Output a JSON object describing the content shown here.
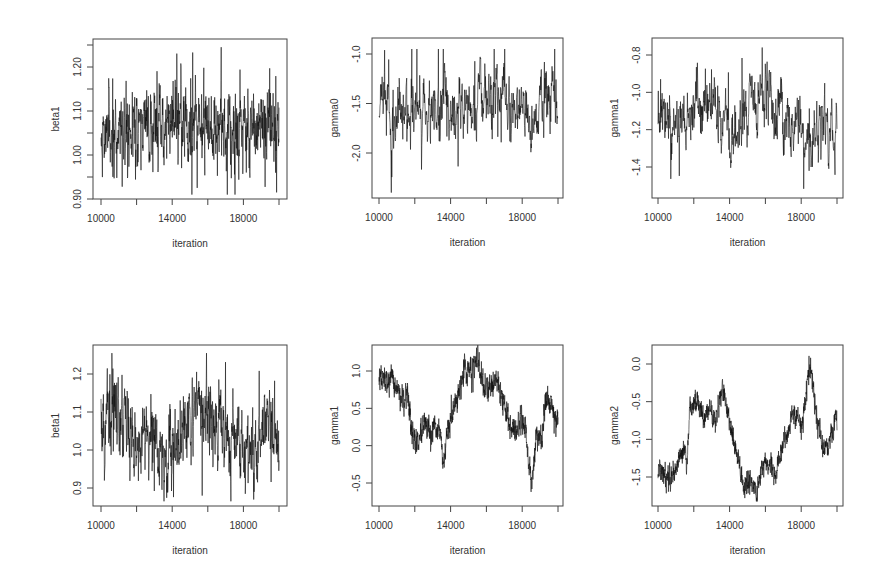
{
  "chart_data": [
    {
      "type": "line",
      "panel": "top-left",
      "title": "",
      "xlabel": "iteration",
      "ylabel": "beta1",
      "xlim": [
        10000,
        20000
      ],
      "ylim": [
        0.885,
        1.25
      ],
      "xticks": [
        10000,
        12000,
        14000,
        16000,
        18000,
        20000
      ],
      "xtick_labels": [
        "10000",
        "",
        "14000",
        "",
        "18000",
        ""
      ],
      "yticks": [
        0.9,
        0.95,
        1.0,
        1.05,
        1.1,
        1.15,
        1.2,
        1.25
      ],
      "ytick_labels": [
        "0.90",
        "",
        "1.00",
        "",
        "1.10",
        "",
        "1.20",
        ""
      ],
      "frame": {
        "x": 93,
        "y": 39,
        "w": 194,
        "h": 160
      },
      "x_px": [
        101,
        279
      ],
      "y_px": {
        "v0": 0.9,
        "p0": 199,
        "v1": 1.2,
        "p1": 67
      },
      "trace": {
        "kind": "fast",
        "mean": 1.065,
        "sd": 0.045,
        "ar": 0.55,
        "min": 0.91,
        "max": 1.245,
        "n": 900,
        "seed": 11,
        "drift": [
          [
            10000,
            1.05
          ],
          [
            12000,
            1.06
          ],
          [
            14000,
            1.08
          ],
          [
            16000,
            1.07
          ],
          [
            18000,
            1.06
          ],
          [
            20000,
            1.07
          ]
        ]
      },
      "grid": false,
      "grid_note": "MCMC trace plot, well mixed"
    },
    {
      "type": "line",
      "panel": "top-middle",
      "title": "",
      "xlabel": "iteration",
      "ylabel": "gamma0",
      "xlim": [
        10000,
        20000
      ],
      "ylim": [
        -2.45,
        -0.85
      ],
      "xticks": [
        10000,
        12000,
        14000,
        16000,
        18000,
        20000
      ],
      "xtick_labels": [
        "10000",
        "",
        "14000",
        "",
        "18000",
        ""
      ],
      "yticks": [
        -2.0,
        -1.5,
        -1.0
      ],
      "ytick_labels": [
        "-2.0",
        "-1.5",
        "-1.0"
      ],
      "frame": {
        "x": 372,
        "y": 38,
        "w": 191,
        "h": 160
      },
      "x_px": [
        379,
        558
      ],
      "y_px": {
        "v0": -2.0,
        "p0": 153,
        "v1": -1.0,
        "p1": 54
      },
      "trace": {
        "kind": "fast",
        "mean": -1.55,
        "sd": 0.17,
        "ar": 0.7,
        "min": -2.4,
        "max": -0.95,
        "n": 700,
        "seed": 23,
        "drift": [
          [
            10000,
            -1.5
          ],
          [
            11000,
            -1.65
          ],
          [
            12000,
            -1.5
          ],
          [
            13500,
            -1.5
          ],
          [
            14200,
            -1.7
          ],
          [
            15000,
            -1.5
          ],
          [
            16500,
            -1.4
          ],
          [
            17500,
            -1.65
          ],
          [
            19000,
            -1.6
          ],
          [
            20000,
            -1.55
          ]
        ]
      },
      "grid": false
    },
    {
      "type": "line",
      "panel": "top-right",
      "title": "",
      "xlabel": "iteration",
      "ylabel": "gamma1",
      "xlim": [
        10000,
        20000
      ],
      "ylim": [
        -1.57,
        -0.74
      ],
      "xticks": [
        10000,
        12000,
        14000,
        16000,
        18000,
        20000
      ],
      "xtick_labels": [
        "10000",
        "",
        "14000",
        "",
        "18000",
        ""
      ],
      "yticks": [
        -1.4,
        -1.2,
        -1.0,
        -0.8
      ],
      "ytick_labels": [
        "-1.4",
        "-1.2",
        "-1.0",
        "-0.8"
      ],
      "frame": {
        "x": 652,
        "y": 38,
        "w": 191,
        "h": 160
      },
      "x_px": [
        658,
        837
      ],
      "y_px": {
        "v0": -1.4,
        "p0": 167,
        "v1": -0.8,
        "p1": 55
      },
      "trace": {
        "kind": "fast",
        "mean": -1.13,
        "sd": 0.09,
        "ar": 0.7,
        "min": -1.56,
        "max": -0.76,
        "n": 700,
        "seed": 37,
        "drift": [
          [
            10000,
            -1.1
          ],
          [
            11000,
            -1.2
          ],
          [
            12000,
            -1.1
          ],
          [
            13500,
            -1.12
          ],
          [
            14200,
            -1.25
          ],
          [
            15000,
            -1.05
          ],
          [
            16500,
            -1.05
          ],
          [
            17500,
            -1.2
          ],
          [
            19000,
            -1.2
          ],
          [
            20000,
            -1.15
          ]
        ]
      },
      "grid": false
    },
    {
      "type": "line",
      "panel": "bottom-left",
      "title": "",
      "xlabel": "iteration",
      "ylabel": "beta1",
      "xlim": [
        10000,
        20000
      ],
      "ylim": [
        0.85,
        1.27
      ],
      "xticks": [
        10000,
        12000,
        14000,
        16000,
        18000,
        20000
      ],
      "xtick_labels": [
        "10000",
        "",
        "14000",
        "",
        "18000",
        ""
      ],
      "yticks": [
        0.9,
        1.0,
        1.1,
        1.2
      ],
      "ytick_labels": [
        "0.9",
        "1.0",
        "1.1",
        "1.2"
      ],
      "frame": {
        "x": 93,
        "y": 345,
        "w": 194,
        "h": 161
      },
      "x_px": [
        101,
        279
      ],
      "y_px": {
        "v0": 0.9,
        "p0": 488,
        "v1": 1.2,
        "p1": 374
      },
      "trace": {
        "kind": "fast",
        "mean": 1.05,
        "sd": 0.05,
        "ar": 0.6,
        "min": 0.865,
        "max": 1.255,
        "n": 900,
        "seed": 51,
        "drift": [
          [
            10000,
            1.08
          ],
          [
            11000,
            1.09
          ],
          [
            12000,
            1.02
          ],
          [
            13000,
            1.03
          ],
          [
            13600,
            0.98
          ],
          [
            14500,
            1.06
          ],
          [
            15500,
            1.12
          ],
          [
            16500,
            1.09
          ],
          [
            17500,
            1.03
          ],
          [
            18500,
            0.99
          ],
          [
            19300,
            1.07
          ],
          [
            20000,
            1.02
          ]
        ]
      },
      "grid": false
    },
    {
      "type": "line",
      "panel": "bottom-middle",
      "title": "",
      "xlabel": "iteration",
      "ylabel": "gamma1",
      "xlim": [
        10000,
        20000
      ],
      "ylim": [
        -0.65,
        1.37
      ],
      "xticks": [
        10000,
        12000,
        14000,
        16000,
        18000,
        20000
      ],
      "xtick_labels": [
        "10000",
        "",
        "14000",
        "",
        "18000",
        ""
      ],
      "yticks": [
        -0.5,
        0.0,
        0.5,
        1.0
      ],
      "ytick_labels": [
        "-0.5",
        "0.0",
        "0.5",
        "1.0"
      ],
      "frame": {
        "x": 372,
        "y": 345,
        "w": 191,
        "h": 161
      },
      "x_px": [
        379,
        558
      ],
      "y_px": {
        "v0": -0.5,
        "p0": 483,
        "v1": 1.0,
        "p1": 371
      },
      "trace": {
        "kind": "slow",
        "sd": 0.09,
        "ar": 0.3,
        "n": 1100,
        "seed": 67,
        "drift": [
          [
            10000,
            0.9
          ],
          [
            10400,
            0.85
          ],
          [
            10800,
            0.85
          ],
          [
            11200,
            0.7
          ],
          [
            11400,
            0.5
          ],
          [
            11600,
            0.75
          ],
          [
            11800,
            0.2
          ],
          [
            12100,
            0.0
          ],
          [
            12600,
            0.3
          ],
          [
            12900,
            0.05
          ],
          [
            13100,
            0.3
          ],
          [
            13400,
            0.2
          ],
          [
            13600,
            -0.3
          ],
          [
            13900,
            0.3
          ],
          [
            14300,
            0.55
          ],
          [
            14700,
            1.0
          ],
          [
            15200,
            1.0
          ],
          [
            15500,
            1.2
          ],
          [
            15800,
            0.75
          ],
          [
            16200,
            0.8
          ],
          [
            16600,
            0.9
          ],
          [
            17000,
            0.55
          ],
          [
            17400,
            0.2
          ],
          [
            17700,
            0.2
          ],
          [
            17900,
            0.4
          ],
          [
            18200,
            0.2
          ],
          [
            18500,
            -0.55
          ],
          [
            18800,
            0.15
          ],
          [
            19100,
            0.1
          ],
          [
            19300,
            0.6
          ],
          [
            19600,
            0.6
          ],
          [
            20000,
            0.25
          ]
        ]
      },
      "grid": false
    },
    {
      "type": "line",
      "panel": "bottom-right",
      "title": "",
      "xlabel": "iteration",
      "ylabel": "gamma2",
      "xlim": [
        10000,
        20000
      ],
      "ylim": [
        -1.9,
        0.22
      ],
      "xticks": [
        10000,
        12000,
        14000,
        16000,
        18000,
        20000
      ],
      "xtick_labels": [
        "10000",
        "",
        "14000",
        "",
        "18000",
        ""
      ],
      "yticks": [
        -1.5,
        -1.0,
        -0.5,
        0.0
      ],
      "ytick_labels": [
        "-1.5",
        "-1.0",
        "-0.5",
        "0.0"
      ],
      "frame": {
        "x": 652,
        "y": 345,
        "w": 191,
        "h": 161
      },
      "x_px": [
        658,
        837
      ],
      "y_px": {
        "v0": -1.5,
        "p0": 477,
        "v1": 0.0,
        "p1": 364
      },
      "trace": {
        "kind": "slow",
        "sd": 0.08,
        "ar": 0.3,
        "n": 1100,
        "seed": 79,
        "drift": [
          [
            10000,
            -1.4
          ],
          [
            10500,
            -1.5
          ],
          [
            11000,
            -1.4
          ],
          [
            11400,
            -1.1
          ],
          [
            11600,
            -1.3
          ],
          [
            11800,
            -0.6
          ],
          [
            12200,
            -0.45
          ],
          [
            12600,
            -0.75
          ],
          [
            12900,
            -0.55
          ],
          [
            13200,
            -0.8
          ],
          [
            13600,
            -0.3
          ],
          [
            14000,
            -0.8
          ],
          [
            14400,
            -1.2
          ],
          [
            14800,
            -1.6
          ],
          [
            15200,
            -1.55
          ],
          [
            15500,
            -1.75
          ],
          [
            15800,
            -1.35
          ],
          [
            16300,
            -1.3
          ],
          [
            16500,
            -1.55
          ],
          [
            16900,
            -1.1
          ],
          [
            17300,
            -0.9
          ],
          [
            17500,
            -0.65
          ],
          [
            17800,
            -0.7
          ],
          [
            18000,
            -0.85
          ],
          [
            18200,
            -0.6
          ],
          [
            18500,
            0.05
          ],
          [
            18800,
            -0.6
          ],
          [
            19200,
            -1.15
          ],
          [
            19600,
            -1.0
          ],
          [
            20000,
            -0.7
          ]
        ]
      },
      "grid": false
    }
  ]
}
